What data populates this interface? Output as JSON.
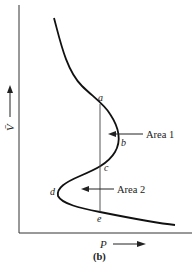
{
  "figure": {
    "caption": "(b)",
    "x_axis_label": "P",
    "y_axis_label": "V̄",
    "points": {
      "a": "a",
      "b": "b",
      "c": "c",
      "d": "d",
      "e": "e"
    },
    "annotations": {
      "area1": "Area 1",
      "area2": "Area 2"
    }
  }
}
